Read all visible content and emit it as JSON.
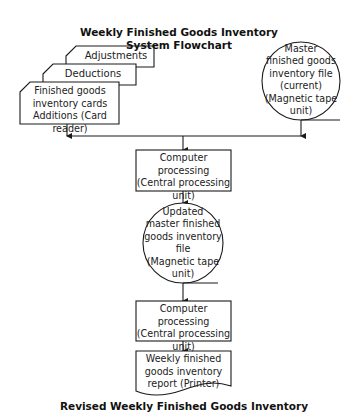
{
  "title": {
    "line1": "Weekly Finished Goods Inventory",
    "line2": "System Flowchart"
  },
  "inputs": {
    "adjustments": "Adjustments",
    "deductions": "Deductions",
    "front_line1": "Finished goods",
    "front_line2": "inventory cards",
    "front_line3": "Additions (Card reader)"
  },
  "master_file": {
    "line1": "Master",
    "line2": "finished goods",
    "line3": "inventory file",
    "line4": "(current)",
    "line5": "(Magnetic tape",
    "line6": "unit)"
  },
  "process1": {
    "line1": "Computer processing",
    "line2": "(Central processing",
    "line3": "unit)"
  },
  "updated_file": {
    "line1": "Updated",
    "line2": "master finished",
    "line3": "goods inventory",
    "line4": "file",
    "line5": "(Magnetic tape",
    "line6": "unit)"
  },
  "process2": {
    "line1": "Computer processing",
    "line2": "(Central processing",
    "line3": "unit)"
  },
  "report": {
    "line1": "Weekly finished",
    "line2": "goods inventory",
    "line3": "report (Printer)"
  },
  "caption": "Revised Weekly Finished Goods Inventory",
  "colors": {
    "line": "#1a1a1a",
    "background": "#ffffff"
  }
}
